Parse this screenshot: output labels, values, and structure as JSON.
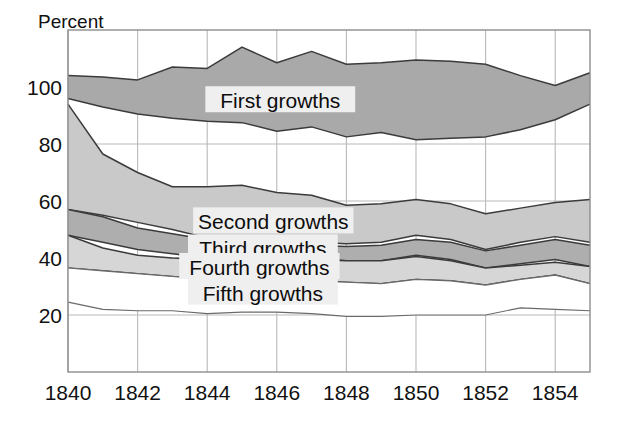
{
  "chart_data": {
    "type": "area",
    "title": "",
    "subtitle": "",
    "xlabel": "",
    "ylabel": "Percent",
    "ylabel_position": "top-left",
    "grid": true,
    "legend_position": "inline-annotations",
    "xlim": [
      1840,
      1855
    ],
    "ylim": [
      0,
      120
    ],
    "x": [
      1840,
      1841,
      1842,
      1843,
      1844,
      1845,
      1846,
      1847,
      1848,
      1849,
      1850,
      1851,
      1852,
      1853,
      1854,
      1855
    ],
    "xticks": [
      1840,
      1842,
      1844,
      1846,
      1848,
      1850,
      1852,
      1854
    ],
    "xticklabels": [
      "1840",
      "1842",
      "1844",
      "1846",
      "1848",
      "1850",
      "1852",
      "1854"
    ],
    "yticks": [
      20,
      40,
      60,
      80,
      100
    ],
    "yticklabels": [
      "20",
      "40",
      "60",
      "80",
      "100"
    ],
    "band_note": "Each growth class is drawn as a band between a lower and an upper price-index bound, in percent.",
    "series": [
      {
        "name": "First growths",
        "label": "First growths",
        "fill_color": "#a9a9a9",
        "upper": [
          104,
          103.5,
          102.5,
          107,
          106.5,
          114,
          108.5,
          112.5,
          108,
          108.5,
          109.5,
          109,
          108,
          104,
          100.5,
          105
        ],
        "lower": [
          96,
          93,
          90.5,
          89,
          88,
          87.5,
          84.5,
          86,
          82.5,
          84,
          81.5,
          82,
          82.5,
          85,
          88.5,
          94
        ]
      },
      {
        "name": "Second growths",
        "label": "Second growths",
        "fill_color": "#c9c9c9",
        "upper": [
          94,
          76.5,
          70,
          65,
          65,
          65.5,
          63,
          62,
          58.5,
          59,
          60.5,
          59,
          55.5,
          57.5,
          59.5,
          60.5
        ],
        "lower": [
          57,
          55,
          52.5,
          50,
          47,
          46,
          45,
          45.5,
          45,
          45.5,
          48,
          46.5,
          43,
          45.5,
          47.5,
          45.5
        ]
      },
      {
        "name": "Third growths",
        "label": "Third growths",
        "fill_color": "#aeaeae",
        "upper": [
          57,
          54.5,
          50.5,
          48.5,
          46.5,
          45.5,
          44.5,
          44.5,
          44,
          44.5,
          46.5,
          45.5,
          42.5,
          44.5,
          46.5,
          44.5
        ],
        "lower": [
          48,
          45.5,
          43,
          41.5,
          40,
          38.5,
          39,
          40,
          39,
          39,
          41,
          39.5,
          36.5,
          38,
          39.5,
          37
        ]
      },
      {
        "name": "Fourth growths",
        "label": "Fourth growths",
        "fill_color": "#d6d6d6",
        "upper": [
          48,
          43.5,
          41,
          40,
          39.5,
          38.5,
          38.5,
          39.5,
          39,
          39,
          40.5,
          39,
          36.5,
          37.5,
          38.5,
          37
        ],
        "lower": [
          36.5,
          35.5,
          34.5,
          33.5,
          32.5,
          31,
          31,
          32,
          31.5,
          31,
          32.5,
          32,
          30.5,
          32.5,
          34,
          31
        ]
      },
      {
        "name": "Fifth growths",
        "label": "Fifth growths",
        "fill_color": "#ffffff",
        "upper": [
          36.5,
          35.5,
          34.5,
          33.5,
          32.5,
          31,
          31,
          32,
          31.5,
          31,
          32.5,
          32,
          30.5,
          32.5,
          34,
          31
        ],
        "lower": [
          24.5,
          22,
          21.5,
          21.5,
          20.5,
          21,
          21,
          20.5,
          19.5,
          19.5,
          20,
          20,
          20,
          22.5,
          22,
          21.5
        ]
      }
    ],
    "annotations": [
      {
        "text": "First growths",
        "x": 1846.1,
        "y": 95.0
      },
      {
        "text": "Second growths",
        "x": 1845.9,
        "y": 52.5
      },
      {
        "text": "Third growths",
        "x": 1845.6,
        "y": 43.0
      },
      {
        "text": "Fourth growths",
        "x": 1845.5,
        "y": 36.5
      },
      {
        "text": "Fifth growths",
        "x": 1845.6,
        "y": 27.5
      }
    ]
  },
  "axis": {
    "ylabel": "Percent",
    "yticks": [
      "100",
      "80",
      "60",
      "40",
      "20"
    ],
    "xticks": [
      "1840",
      "1842",
      "1844",
      "1846",
      "1848",
      "1850",
      "1852",
      "1854"
    ]
  },
  "labels": {
    "first": "First growths",
    "second": "Second growths",
    "third": "Third growths",
    "fourth": "Fourth growths",
    "fifth": "Fifth growths"
  },
  "colors": {
    "first_fill": "#a9a9a9",
    "second_fill": "#c9c9c9",
    "third_fill": "#aeaeae",
    "fourth_fill": "#d6d6d6",
    "fifth_fill": "#ffffff",
    "outline": "#3b3b3b",
    "grid": "#b9b9b9",
    "frame": "#8d8d8d",
    "text": "#111111",
    "label_bg": "#efefef",
    "background": "#ffffff"
  }
}
